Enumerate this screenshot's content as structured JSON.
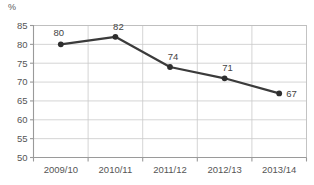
{
  "chart_data": {
    "type": "line",
    "title": "",
    "subtitle": "",
    "xlabel": "",
    "ylabel": "%",
    "unit_label": "%",
    "categories": [
      "2009/10",
      "2010/11",
      "2011/12",
      "2012/13",
      "2013/14"
    ],
    "values": [
      80,
      82,
      74,
      71,
      67
    ],
    "data_labels": [
      "80",
      "82",
      "74",
      "71",
      "67"
    ],
    "ylim": [
      50,
      85
    ],
    "yticks": [
      50,
      55,
      60,
      65,
      70,
      75,
      80,
      85
    ],
    "ytick_labels": [
      "50",
      "55",
      "60",
      "65",
      "70",
      "75",
      "80",
      "85"
    ],
    "grid": {
      "horizontal": true,
      "vertical": true
    },
    "legend": {
      "visible": false,
      "position": "none",
      "entries": []
    },
    "markers": {
      "visible": true,
      "shape": "circle"
    },
    "colors": {
      "line": "#3b3b3b",
      "marker": "#2e2e2e",
      "gridline": "#c9c9c9",
      "axis": "#9a9a9a",
      "tick_text": "#555555",
      "label_text": "#444444",
      "plot_border": "#bdbdbd",
      "background": "#ffffff"
    }
  }
}
